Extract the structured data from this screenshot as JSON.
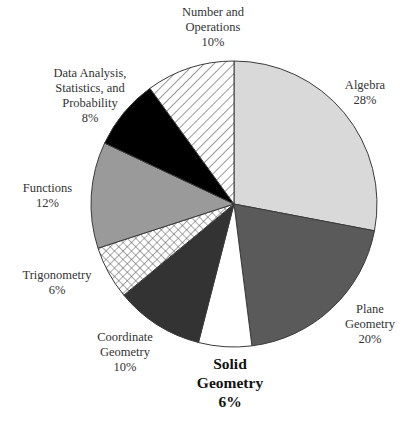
{
  "chart_data": {
    "type": "pie",
    "title": "",
    "start_angle_deg": 0,
    "direction": "clockwise",
    "slices": [
      {
        "label": "Algebra",
        "value": 28,
        "display": "28%",
        "fill": "#d9d9d9",
        "pattern": "solid"
      },
      {
        "label": "Plane Geometry",
        "value": 20,
        "display": "20%",
        "fill": "#5a5a5a",
        "pattern": "solid"
      },
      {
        "label": "Solid Geometry",
        "value": 6,
        "display": "6%",
        "fill": "#ffffff",
        "pattern": "solid",
        "highlighted": true
      },
      {
        "label": "Coordinate Geometry",
        "value": 10,
        "display": "10%",
        "fill": "#333333",
        "pattern": "solid"
      },
      {
        "label": "Trigonometry",
        "value": 6,
        "display": "6%",
        "fill": "#ffffff",
        "pattern": "crosshatch"
      },
      {
        "label": "Functions",
        "value": 12,
        "display": "12%",
        "fill": "#9a9a9a",
        "pattern": "solid"
      },
      {
        "label": "Data Analysis, Statistics, and Probability",
        "value": 8,
        "display": "8%",
        "fill": "#000000",
        "pattern": "solid"
      },
      {
        "label": "Number and Operations",
        "value": 10,
        "display": "10%",
        "fill": "#ffffff",
        "pattern": "diagonal-hatch"
      }
    ]
  },
  "labels": {
    "algebra": {
      "lines": [
        "Algebra"
      ],
      "pct": "28%"
    },
    "plane": {
      "lines": [
        "Plane",
        "Geometry"
      ],
      "pct": "20%"
    },
    "solid": {
      "lines": [
        "Solid",
        "Geometry"
      ],
      "pct": "6%"
    },
    "coordinate": {
      "lines": [
        "Coordinate",
        "Geometry"
      ],
      "pct": "10%"
    },
    "trig": {
      "lines": [
        "Trigonometry"
      ],
      "pct": "6%"
    },
    "functions": {
      "lines": [
        "Functions"
      ],
      "pct": "12%"
    },
    "data": {
      "lines": [
        "Data Analysis,",
        "Statistics, and",
        "Probability"
      ],
      "pct": "8%"
    },
    "number": {
      "lines": [
        "Number and",
        "Operations"
      ],
      "pct": "10%"
    }
  }
}
